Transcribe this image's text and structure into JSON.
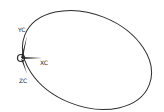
{
  "drawing": {
    "stroke_color": "#2a2a2a",
    "background": "#ffffff",
    "ellipse": {
      "cx": 86,
      "cy": 57,
      "rx": 68,
      "ry": 48,
      "rotation_deg": 22
    },
    "triad": {
      "origin": {
        "x": 21,
        "y": 58
      },
      "axes": [
        {
          "name": "YC",
          "label": "YC"
        },
        {
          "name": "XC",
          "label": "XC"
        },
        {
          "name": "ZC",
          "label": "ZC"
        }
      ]
    }
  }
}
